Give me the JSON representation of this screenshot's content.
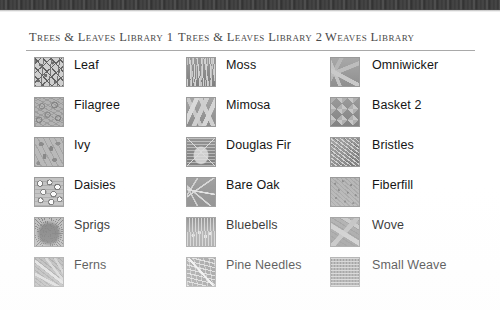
{
  "page": {
    "scan_edge_present": true
  },
  "columns": [
    {
      "header": "Trees & Leaves Library 1",
      "items": [
        {
          "label": "Leaf",
          "texture": "leaf"
        },
        {
          "label": "Filagree",
          "texture": "filagree"
        },
        {
          "label": "Ivy",
          "texture": "ivy"
        },
        {
          "label": "Daisies",
          "texture": "daisies"
        },
        {
          "label": "Sprigs",
          "texture": "sprigs"
        },
        {
          "label": "Ferns",
          "texture": "ferns"
        }
      ]
    },
    {
      "header": "Trees & Leaves Library 2",
      "items": [
        {
          "label": "Moss",
          "texture": "moss"
        },
        {
          "label": "Mimosa",
          "texture": "mimosa"
        },
        {
          "label": "Douglas Fir",
          "texture": "douglasfir"
        },
        {
          "label": "Bare Oak",
          "texture": "bareoak"
        },
        {
          "label": "Bluebells",
          "texture": "bluebells"
        },
        {
          "label": "Pine Needles",
          "texture": "pineneedles"
        }
      ]
    },
    {
      "header": "Weaves Library",
      "items": [
        {
          "label": "Omniwicker",
          "texture": "omniwicker"
        },
        {
          "label": "Basket 2",
          "texture": "basket2"
        },
        {
          "label": "Bristles",
          "texture": "bristles"
        },
        {
          "label": "Fiberfill",
          "texture": "fiberfill"
        },
        {
          "label": "Wove",
          "texture": "wove"
        },
        {
          "label": "Small Weave",
          "texture": "smallweave"
        }
      ]
    }
  ]
}
